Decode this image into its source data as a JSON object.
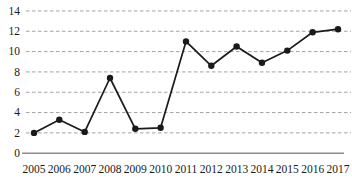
{
  "chart_data": {
    "type": "line",
    "title": "",
    "xlabel": "",
    "ylabel": "",
    "categories": [
      "2005",
      "2006",
      "2007",
      "2008",
      "2009",
      "2010",
      "2011",
      "2012",
      "2013",
      "2014",
      "2015",
      "2016",
      "2017"
    ],
    "series": [
      {
        "name": "series-1",
        "values": [
          2.0,
          3.3,
          2.1,
          7.4,
          2.4,
          2.5,
          11.0,
          8.6,
          10.5,
          8.9,
          10.1,
          11.9,
          12.2
        ]
      }
    ],
    "ylim": [
      0,
      14
    ],
    "ytick_step": 2,
    "ytick_labels": [
      "0",
      "2",
      "4",
      "6",
      "8",
      "10",
      "12",
      "14"
    ],
    "grid": "horizontal-dashed",
    "legend": "none",
    "marker": "filled-circle",
    "colors": {
      "line": "#1a1a1a",
      "marker": "#1a1a1a",
      "gridline": "#a3a3a3",
      "axis": "#8c8c8c",
      "text": "#1a1a1a",
      "background": "#ffffff"
    }
  }
}
